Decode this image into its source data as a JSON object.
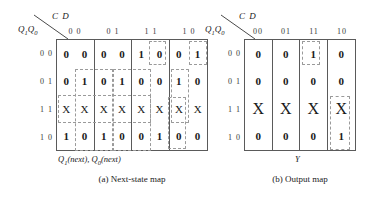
{
  "figure": {
    "maps": [
      {
        "id": "next-state-map",
        "col_var": "C D",
        "row_var_html": "Q1Q0",
        "col_labels": [
          "0 0",
          "0 1",
          "1 1",
          "1 0"
        ],
        "row_labels": [
          "0 0",
          "0 1",
          "1 1",
          "1 0"
        ],
        "cells": [
          [
            [
              "0",
              "0"
            ],
            [
              "0",
              "0"
            ],
            [
              "1",
              "0"
            ],
            [
              "0",
              "1"
            ]
          ],
          [
            [
              "0",
              "1"
            ],
            [
              "0",
              "1"
            ],
            [
              "0",
              "0"
            ],
            [
              "1",
              "0"
            ]
          ],
          [
            [
              "X",
              "X"
            ],
            [
              "X",
              "X"
            ],
            [
              "X",
              "X"
            ],
            [
              "X",
              "X"
            ]
          ],
          [
            [
              "1",
              "0"
            ],
            [
              "1",
              "0"
            ],
            [
              "0",
              "1"
            ],
            [
              "0",
              "0"
            ]
          ]
        ],
        "axis_label": "Q1(next), Q0(next)",
        "caption": "(a) Next-state map"
      },
      {
        "id": "output-map",
        "col_var": "C D",
        "row_var_html": "Q1Q0",
        "col_labels": [
          "00",
          "01",
          "11",
          "10"
        ],
        "row_labels": [
          "0 0",
          "0 1",
          "1 1",
          "1 0"
        ],
        "cells": [
          [
            "0",
            "0",
            "1",
            "0"
          ],
          [
            "0",
            "0",
            "0",
            "0"
          ],
          [
            "X",
            "X",
            "X",
            "X"
          ],
          [
            "0",
            "0",
            "0",
            "1"
          ]
        ],
        "axis_label": "Y",
        "caption": "(b) Output map"
      }
    ],
    "colors": {
      "grid_line": "#5a5a5a",
      "group_dash": "#9a9a9a",
      "text": "#1a1a1a"
    }
  }
}
